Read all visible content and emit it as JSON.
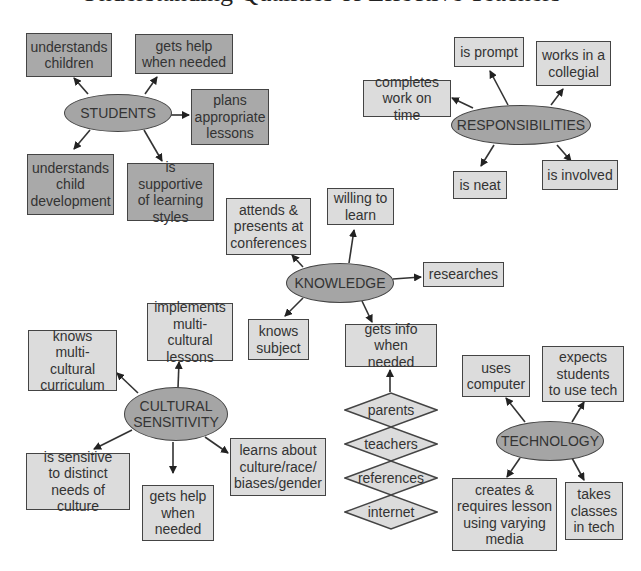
{
  "title": "Understanding Qualities of Effective Teachers",
  "colors": {
    "hub_fill": "#a5a5a5",
    "students_box_fill": "#a9a9a9",
    "other_box_fill": "#dcdcdc",
    "stroke": "#444444"
  },
  "hubs": {
    "students": {
      "label": "STUDENTS"
    },
    "responsibilities": {
      "label": "RESPONSIBILITIES"
    },
    "knowledge": {
      "label": "KNOWLEDGE"
    },
    "cultural": {
      "line1": "CULTURAL",
      "line2": "SENSITIVITY"
    },
    "technology": {
      "label": "TECHNOLOGY"
    }
  },
  "students": {
    "understands_children": [
      "understands",
      "children"
    ],
    "gets_help": [
      "gets help",
      "when needed"
    ],
    "plans": [
      "plans",
      "appropriate",
      "lessons"
    ],
    "child_dev": [
      "understands",
      "child",
      "development"
    ],
    "supportive": [
      "is supportive",
      "of learning",
      "styles"
    ]
  },
  "responsibilities": {
    "prompt": [
      "is prompt"
    ],
    "collegial": [
      "works in a",
      "collegial"
    ],
    "completes": [
      "completes",
      "work on time"
    ],
    "neat": [
      "is neat"
    ],
    "involved": [
      "is involved"
    ]
  },
  "knowledge": {
    "attends": [
      "attends &",
      "presents at",
      "conferences"
    ],
    "willing": [
      "willing to",
      "learn"
    ],
    "researches": [
      "researches"
    ],
    "knows_subject": [
      "knows",
      "subject"
    ],
    "gets_info": [
      "gets info",
      "when needed"
    ]
  },
  "sources": [
    "parents",
    "teachers",
    "references",
    "internet"
  ],
  "cultural": {
    "implements": [
      "implements",
      "multi-cultural",
      "lessons"
    ],
    "knows_curriculum": [
      "knows",
      "multi-cultural",
      "curriculum"
    ],
    "sensitive": [
      "is sensitive",
      "to distinct",
      "needs of culture"
    ],
    "gets_help": [
      "gets help",
      "when",
      "needed"
    ],
    "learns": [
      "learns about",
      "culture/race/",
      "biases/gender"
    ]
  },
  "technology": {
    "uses_computer": [
      "uses",
      "computer"
    ],
    "expects": [
      "expects",
      "students",
      "to use tech"
    ],
    "creates": [
      "creates &",
      "requires lesson",
      "using varying",
      "media"
    ],
    "takes": [
      "takes",
      "classes",
      "in tech"
    ]
  }
}
